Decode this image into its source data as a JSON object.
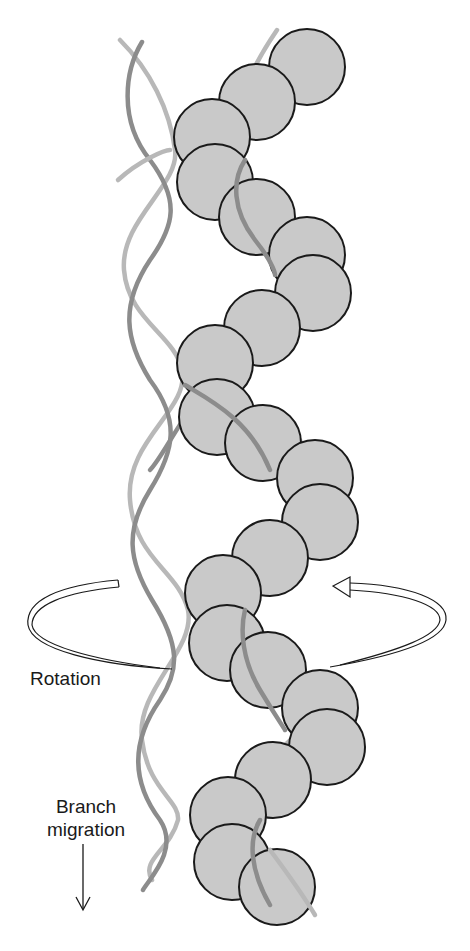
{
  "figure": {
    "labels": {
      "rotation": "Rotation",
      "branch_line1": "Branch",
      "branch_line2": "migration"
    },
    "colors": {
      "background": "#ffffff",
      "protein_fill": "#c9c9c9",
      "protein_stroke": "#1a1a1a",
      "strand_dark": "#8c8c8c",
      "strand_light": "#b8b8b8",
      "arrow_stroke": "#1a1a1a"
    },
    "protein_subunits": [
      {
        "cx": 307,
        "cy": 67
      },
      {
        "cx": 257,
        "cy": 102
      },
      {
        "cx": 212,
        "cy": 137
      },
      {
        "cx": 215,
        "cy": 182
      },
      {
        "cx": 257,
        "cy": 217
      },
      {
        "cx": 307,
        "cy": 255
      },
      {
        "cx": 313,
        "cy": 293
      },
      {
        "cx": 262,
        "cy": 328
      },
      {
        "cx": 215,
        "cy": 363
      },
      {
        "cx": 217,
        "cy": 417
      },
      {
        "cx": 263,
        "cy": 443
      },
      {
        "cx": 315,
        "cy": 478
      },
      {
        "cx": 320,
        "cy": 522
      },
      {
        "cx": 270,
        "cy": 558
      },
      {
        "cx": 223,
        "cy": 593
      },
      {
        "cx": 227,
        "cy": 643
      },
      {
        "cx": 268,
        "cy": 670
      },
      {
        "cx": 320,
        "cy": 708
      },
      {
        "cx": 327,
        "cy": 747
      },
      {
        "cx": 273,
        "cy": 780
      },
      {
        "cx": 228,
        "cy": 815
      },
      {
        "cx": 232,
        "cy": 862
      },
      {
        "cx": 277,
        "cy": 887
      }
    ],
    "subunit_radius": 38
  }
}
